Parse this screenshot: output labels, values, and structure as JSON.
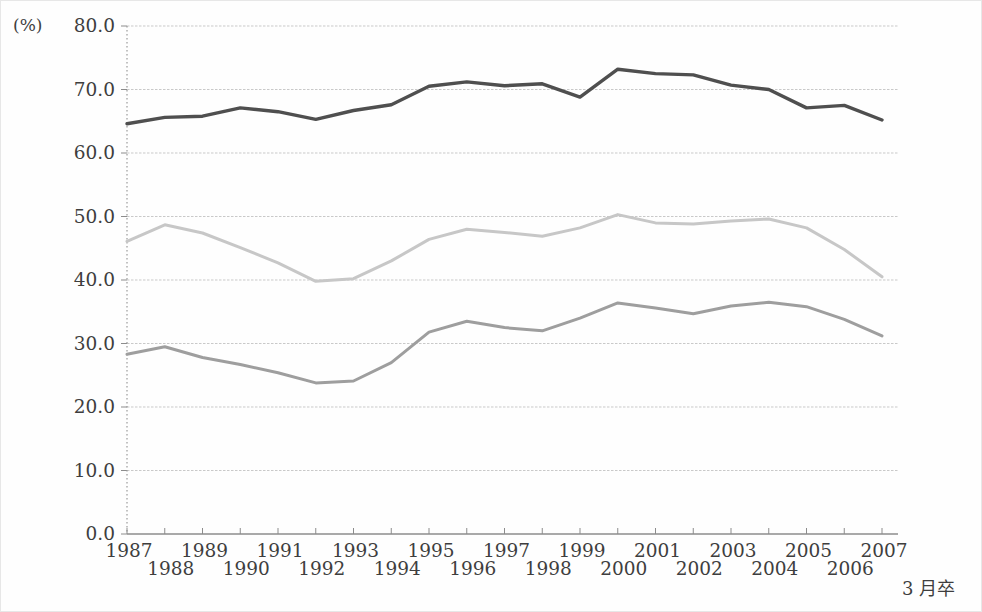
{
  "chart_data": {
    "type": "line",
    "title": "",
    "unit_label": "(%)",
    "x_axis_note": "3 月卒",
    "xlabel": "",
    "ylabel": "(%)",
    "ylim": [
      0,
      80
    ],
    "grid": true,
    "legend": "none",
    "x": [
      1987,
      1988,
      1989,
      1990,
      1991,
      1992,
      1993,
      1994,
      1995,
      1996,
      1997,
      1998,
      1999,
      2000,
      2001,
      2002,
      2003,
      2004,
      2005,
      2006,
      2007
    ],
    "x_tick_labels": [
      "1987",
      "1988",
      "1989",
      "1990",
      "1991",
      "1992",
      "1993",
      "1994",
      "1995",
      "1996",
      "1997",
      "1998",
      "1999",
      "2000",
      "2001",
      "2002",
      "2003",
      "2004",
      "2005",
      "2006",
      "2007"
    ],
    "y_ticks": [
      0,
      10,
      20,
      30,
      40,
      50,
      60,
      70,
      80
    ],
    "y_tick_labels": [
      "0.0",
      "10.0",
      "20.0",
      "30.0",
      "40.0",
      "50.0",
      "60.0",
      "70.0",
      "80.0"
    ],
    "series": [
      {
        "name": "upper-line",
        "color": "#4f4f4f",
        "stroke_width": 3.4,
        "values": [
          64.6,
          65.6,
          65.8,
          67.1,
          66.5,
          65.3,
          66.7,
          67.6,
          70.5,
          71.2,
          70.6,
          70.9,
          68.8,
          73.2,
          72.5,
          72.3,
          70.7,
          70.0,
          67.1,
          67.5,
          65.2
        ]
      },
      {
        "name": "middle-line",
        "color": "#c7c7c7",
        "stroke_width": 3.0,
        "values": [
          46.1,
          48.7,
          47.4,
          45.1,
          42.7,
          39.8,
          40.2,
          43.0,
          46.4,
          48.0,
          47.5,
          46.9,
          48.2,
          50.3,
          49.0,
          48.8,
          49.3,
          49.6,
          48.2,
          44.8,
          40.5
        ]
      },
      {
        "name": "lower-line",
        "color": "#9e9e9e",
        "stroke_width": 3.0,
        "values": [
          28.3,
          29.5,
          27.8,
          26.7,
          25.4,
          23.8,
          24.1,
          27.0,
          31.8,
          33.5,
          32.5,
          32.0,
          34.0,
          36.4,
          35.6,
          34.7,
          35.9,
          36.5,
          35.8,
          33.8,
          31.2
        ]
      }
    ],
    "axis_colors": {
      "grid_line": "#c9c9c9",
      "y_axis_dotted": "#9a9a9a",
      "x_axis": "#8c8c8c",
      "tick": "#8c8c8c"
    }
  }
}
